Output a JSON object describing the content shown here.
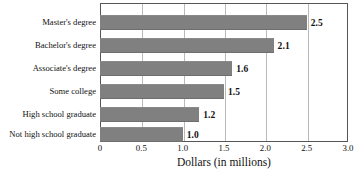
{
  "chart_data": {
    "type": "bar",
    "orientation": "horizontal",
    "title": "",
    "subtitle": "",
    "xlabel": "Dollars (in millions)",
    "ylabel": "",
    "xlim": [
      0,
      3.0
    ],
    "xticks": [
      "0",
      "0.5",
      "1.0",
      "1.5",
      "2.0",
      "2.5",
      "3.0"
    ],
    "xtick_values": [
      0,
      0.5,
      1.0,
      1.5,
      2.0,
      2.5,
      3.0
    ],
    "grid": "vertical",
    "legend": "none",
    "categories": [
      "Master's degree",
      "Bachelor's degree",
      "Associate's degree",
      "Some college",
      "High school graduate",
      "Not high school graduate"
    ],
    "values": [
      2.5,
      2.1,
      1.6,
      1.5,
      1.2,
      1.0
    ],
    "data_labels": [
      "2.5",
      "2.1",
      "1.6",
      "1.5",
      "1.2",
      "1.0"
    ],
    "bar_color": "#808080",
    "frame_color": "#555555",
    "gridline_color": "#b9b9b9"
  },
  "source_note": ""
}
